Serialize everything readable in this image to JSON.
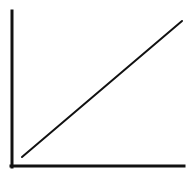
{
  "diagram": {
    "colors": {
      "background": "#ffffff",
      "stroke": "#111111"
    },
    "y_axis": {
      "x": 12,
      "y1": 11,
      "y2": 167,
      "width": 3
    },
    "x_axis": {
      "y": 166,
      "x1": 11,
      "x2": 184,
      "width": 3
    },
    "line": {
      "x1": 22,
      "y1": 157,
      "x2": 182,
      "y2": 21,
      "width": 2
    }
  }
}
